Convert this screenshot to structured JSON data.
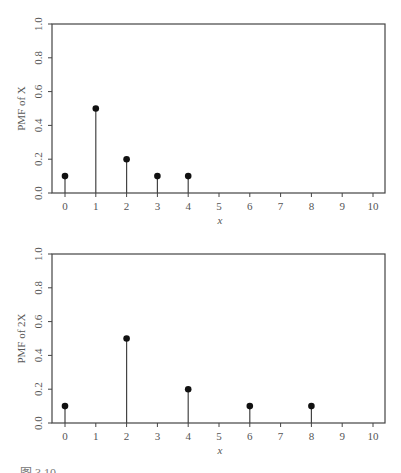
{
  "figure": {
    "caption": "图 3.10 …"
  },
  "chart_data": [
    {
      "type": "stem",
      "title": "",
      "xlabel": "x",
      "ylabel": "PMF of X",
      "x_ticks": [
        0,
        1,
        2,
        3,
        4,
        5,
        6,
        7,
        8,
        9,
        10
      ],
      "y_ticks": [
        "0.0",
        "0.2",
        "0.4",
        "0.6",
        "0.8",
        "1.0"
      ],
      "xlim": [
        -0.4,
        10.4
      ],
      "ylim": [
        0,
        1.0
      ],
      "grid": false,
      "x": [
        0,
        1,
        2,
        3,
        4
      ],
      "values": [
        0.1,
        0.5,
        0.2,
        0.1,
        0.1
      ]
    },
    {
      "type": "stem",
      "title": "",
      "xlabel": "x",
      "ylabel": "PMF of 2X",
      "x_ticks": [
        0,
        1,
        2,
        3,
        4,
        5,
        6,
        7,
        8,
        9,
        10
      ],
      "y_ticks": [
        "0.0",
        "0.2",
        "0.4",
        "0.6",
        "0.8",
        "1.0"
      ],
      "xlim": [
        -0.4,
        10.4
      ],
      "ylim": [
        0,
        1.0
      ],
      "grid": false,
      "x": [
        0,
        2,
        4,
        6,
        8
      ],
      "values": [
        0.1,
        0.5,
        0.2,
        0.1,
        0.1
      ]
    }
  ],
  "style": {
    "axis_color": "#444444",
    "stem_color": "#444444",
    "marker_color": "#111111"
  }
}
